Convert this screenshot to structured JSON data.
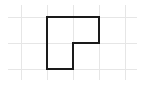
{
  "diagram": {
    "type": "grid-shape",
    "canvas": {
      "width": 145,
      "height": 85
    },
    "grid": {
      "color": "#e6e6e6",
      "vertical_x": [
        21,
        47,
        73,
        99,
        125
      ],
      "horizontal_y": [
        17,
        43,
        69
      ],
      "cell_size": 26
    },
    "shape": {
      "name": "L-shape",
      "stroke": "#1a1a1a",
      "stroke_width": 2,
      "points": "47,17 99,17 99,43 73,43 73,69 47,69"
    }
  }
}
